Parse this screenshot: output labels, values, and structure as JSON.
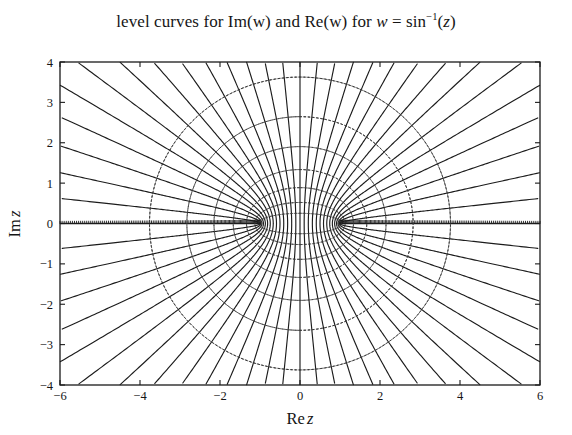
{
  "figure": {
    "title_parts": {
      "prefix": "level curves for Im(w) and Re(w) for ",
      "w": "w",
      "eq": " = ",
      "fn": "sin",
      "exp": "−1",
      "arg_open": "(",
      "z": "z",
      "arg_close": ")"
    },
    "title_plain": "level curves for Im(w) and Re(w) for w = sin^-1(z)",
    "background": "#ffffff",
    "frame_color": "#1a1a1a",
    "solid_curve_color": "#1c1c1c",
    "dotted_curve_color": "#3a3a3a"
  },
  "chart_data": {
    "type": "line",
    "xlabel": "Re z",
    "ylabel": "Im z",
    "xlim": [
      -6,
      6
    ],
    "ylim": [
      -4,
      4
    ],
    "xticks": [
      -6,
      -4,
      -2,
      0,
      2,
      4,
      6
    ],
    "xticklabels": [
      "−6",
      "−4",
      "−2",
      "0",
      "2",
      "4",
      "6"
    ],
    "yticks": [
      -4,
      -3,
      -2,
      -1,
      0,
      1,
      2,
      3,
      4
    ],
    "yticklabels": [
      "−4",
      "−3",
      "−2",
      "−1",
      "0",
      "1",
      "2",
      "3",
      "4"
    ],
    "grid": false,
    "legend": null,
    "branch_points": [
      -1,
      1
    ],
    "series": [
      {
        "name": "Re(w) level curves",
        "style": "solid",
        "color": "#1c1c1c",
        "description": "Confocal hyperbolas z = sin(u + i v) with u held constant; foci at z = -1 and z = +1",
        "parameter": "u",
        "levels": [
          -1.5708,
          -1.4661,
          -1.3614,
          -1.2566,
          -1.1519,
          -1.0472,
          -0.9425,
          -0.8378,
          -0.733,
          -0.6283,
          -0.5236,
          -0.4189,
          -0.3142,
          -0.2094,
          -0.1047,
          0.0,
          0.1047,
          0.2094,
          0.3142,
          0.4189,
          0.5236,
          0.6283,
          0.733,
          0.8378,
          0.9425,
          1.0472,
          1.1519,
          1.2566,
          1.3614,
          1.4661,
          1.5708
        ]
      },
      {
        "name": "Im(w) level curves",
        "style": "dotted",
        "color": "#3a3a3a",
        "description": "Confocal ellipses z = sin(u + i v) with v held constant; foci at z = -1 and z = +1",
        "parameter": "v",
        "levels": [
          -2.0,
          -1.7,
          -1.4,
          -1.1,
          -0.8,
          -0.5,
          -0.25,
          0.25,
          0.5,
          0.8,
          1.1,
          1.4,
          1.7,
          2.0
        ],
        "semi_minor_axes_on_imaginary_axis": [
          3.63,
          2.65,
          1.9,
          1.34,
          0.89,
          0.52,
          0.25
        ]
      }
    ]
  }
}
